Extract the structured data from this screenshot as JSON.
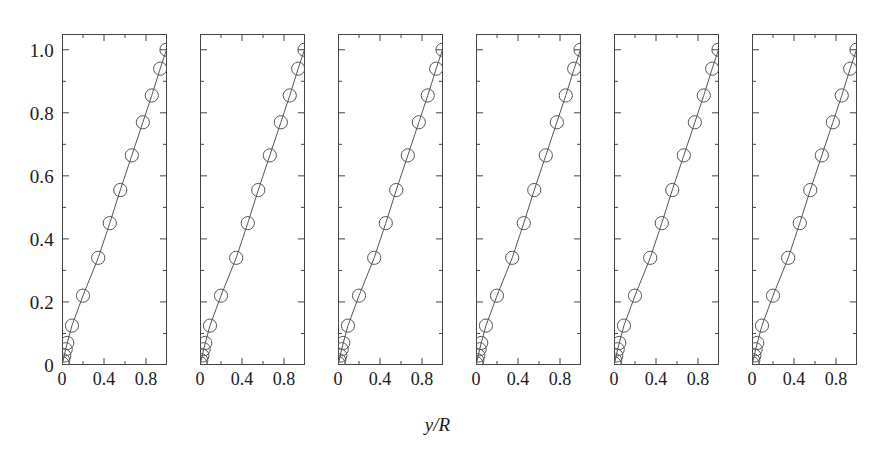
{
  "chart_data": {
    "type": "scatter",
    "title": "",
    "subtitle": "",
    "xlabel": "y/R",
    "ylabel": "",
    "xlim": [
      0.0,
      1.0
    ],
    "ylim": [
      0.0,
      1.05
    ],
    "grid": false,
    "legend": null,
    "panel_count": 6,
    "marker": "open-circle",
    "line": "solid-thin",
    "marker_color": "#555555",
    "line_color": "#555555",
    "axis_color": "#444444",
    "x_major_ticks": [
      0.0,
      0.4,
      0.8
    ],
    "x_minor_ticks": [
      0.2,
      0.6,
      1.0
    ],
    "x_ticklabels": [
      "0",
      "0.4",
      "0.8"
    ],
    "y_major_ticks": [
      0.0,
      0.2,
      0.4,
      0.6,
      0.8,
      1.0
    ],
    "y_minor_ticks": [
      0.1,
      0.3,
      0.5,
      0.7,
      0.9
    ],
    "y_ticklabels": [
      "0",
      "0.2",
      "0.4",
      "0.6",
      "0.8",
      "1.0"
    ],
    "panels": [
      {
        "name": "panel-1",
        "x": [
          0.005,
          0.012,
          0.022,
          0.035,
          0.05,
          0.095,
          0.2,
          0.345,
          0.455,
          0.555,
          0.665,
          0.77,
          0.855,
          0.935,
          0.995
        ],
        "y": [
          0.005,
          0.015,
          0.03,
          0.05,
          0.07,
          0.125,
          0.22,
          0.34,
          0.45,
          0.555,
          0.665,
          0.77,
          0.855,
          0.94,
          1.0
        ]
      },
      {
        "name": "panel-2",
        "x": [
          0.005,
          0.012,
          0.022,
          0.035,
          0.05,
          0.095,
          0.2,
          0.345,
          0.455,
          0.555,
          0.665,
          0.77,
          0.855,
          0.935,
          0.995
        ],
        "y": [
          0.005,
          0.015,
          0.03,
          0.05,
          0.07,
          0.125,
          0.22,
          0.34,
          0.45,
          0.555,
          0.665,
          0.77,
          0.855,
          0.94,
          1.0
        ]
      },
      {
        "name": "panel-3",
        "x": [
          0.005,
          0.012,
          0.022,
          0.035,
          0.05,
          0.095,
          0.2,
          0.345,
          0.455,
          0.555,
          0.665,
          0.77,
          0.855,
          0.935,
          0.995
        ],
        "y": [
          0.005,
          0.015,
          0.03,
          0.05,
          0.07,
          0.125,
          0.22,
          0.34,
          0.45,
          0.555,
          0.665,
          0.77,
          0.855,
          0.94,
          1.0
        ]
      },
      {
        "name": "panel-4",
        "x": [
          0.005,
          0.012,
          0.022,
          0.035,
          0.05,
          0.095,
          0.2,
          0.345,
          0.455,
          0.555,
          0.665,
          0.77,
          0.855,
          0.935,
          0.995
        ],
        "y": [
          0.005,
          0.015,
          0.03,
          0.05,
          0.07,
          0.125,
          0.22,
          0.34,
          0.45,
          0.555,
          0.665,
          0.77,
          0.855,
          0.94,
          1.0
        ]
      },
      {
        "name": "panel-5",
        "x": [
          0.005,
          0.012,
          0.022,
          0.035,
          0.05,
          0.095,
          0.2,
          0.345,
          0.455,
          0.555,
          0.665,
          0.77,
          0.855,
          0.935,
          0.995
        ],
        "y": [
          0.005,
          0.015,
          0.03,
          0.05,
          0.07,
          0.125,
          0.22,
          0.34,
          0.45,
          0.555,
          0.665,
          0.77,
          0.855,
          0.94,
          1.0
        ]
      },
      {
        "name": "panel-6",
        "x": [
          0.005,
          0.012,
          0.022,
          0.035,
          0.05,
          0.095,
          0.2,
          0.345,
          0.455,
          0.555,
          0.665,
          0.77,
          0.855,
          0.935,
          0.995
        ],
        "y": [
          0.005,
          0.015,
          0.03,
          0.05,
          0.07,
          0.125,
          0.22,
          0.34,
          0.45,
          0.555,
          0.665,
          0.77,
          0.855,
          0.94,
          1.0
        ]
      }
    ]
  },
  "layout": {
    "panel_left_positions": [
      62,
      200,
      338,
      476,
      614,
      752
    ],
    "panel_width": 105,
    "panel_top": 34,
    "panel_height": 331
  }
}
